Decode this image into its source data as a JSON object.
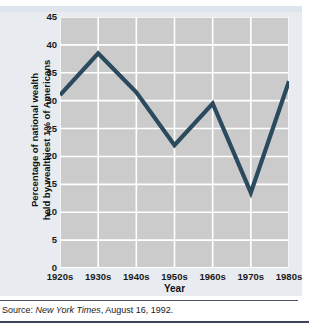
{
  "chart_data": {
    "type": "line",
    "title": "",
    "xlabel": "Year",
    "ylabel": "Percentage of national wealth held by wealthiest 1% of Americans",
    "ylabel_line1": "Percentage of national wealth",
    "ylabel_line2": "held by wealthiest 1% of Americans",
    "categories": [
      "1920s",
      "1930s",
      "1940s",
      "1950s",
      "1960s",
      "1970s",
      "1980s"
    ],
    "values": [
      31,
      38.5,
      31.5,
      22,
      29.5,
      13.5,
      33.5
    ],
    "series": [
      {
        "name": "Percentage of national wealth held by wealthiest 1% of Americans",
        "values": [
          31,
          38.5,
          31.5,
          22,
          29.5,
          13.5,
          33.5
        ]
      }
    ],
    "ylim": [
      0,
      45
    ],
    "yticks": [
      0,
      5,
      10,
      15,
      20,
      25,
      30,
      35,
      40,
      45
    ],
    "ytick_labels": [
      "0",
      "5",
      "10",
      "15",
      "20",
      "25",
      "30",
      "35",
      "40",
      "45"
    ],
    "xtick_labels": [
      "1920s",
      "1930s",
      "1940s",
      "1950s",
      "1960s",
      "1970s",
      "1980s"
    ],
    "grid": true,
    "grid_axis": "y",
    "legend": false,
    "legend_position": "none",
    "line_color": "#2b4a5e",
    "plot_background": "#cbcbcb",
    "panel_background": "#e8ecf1",
    "gridline_color": "#ffffff"
  },
  "footer": {
    "source_prefix": "Source: ",
    "source_publication": "New York Times",
    "source_suffix": ", August 16, 1992."
  }
}
